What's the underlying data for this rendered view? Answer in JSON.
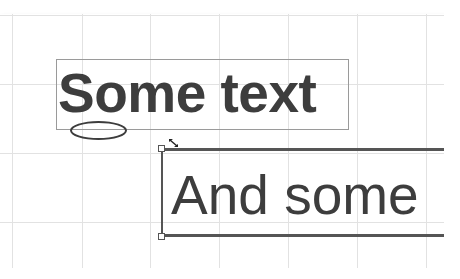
{
  "canvas": {
    "grid_spacing_px": 69,
    "grid_color": "#e2e2e2",
    "text_color": "#3d3d3d"
  },
  "shapes": [
    {
      "type": "text-box",
      "text": "Some text",
      "font_weight": "bold",
      "border": "thin-gray"
    },
    {
      "type": "ellipse"
    },
    {
      "type": "text-box",
      "text": "And some",
      "font_weight": "normal",
      "border": "thick-selected",
      "selected": true
    }
  ],
  "cursor": {
    "icon": "resize-diagonal-cursor"
  }
}
